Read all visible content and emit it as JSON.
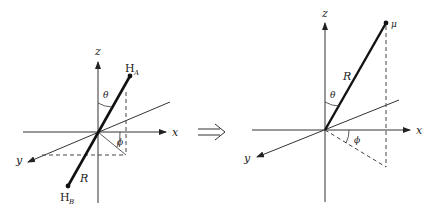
{
  "diagram": {
    "left": {
      "axes": {
        "x": "x",
        "y": "y",
        "z": "z"
      },
      "atom_a": {
        "label": "H",
        "subscript": "A"
      },
      "atom_b": {
        "label": "H",
        "subscript": "B"
      },
      "bond_label": "R",
      "polar_angle": "θ",
      "azimuth_angle": "ϕ"
    },
    "transition_arrow": "⟹",
    "right": {
      "axes": {
        "x": "x",
        "y": "y",
        "z": "z"
      },
      "point_label": "μ",
      "vector_label": "R",
      "polar_angle": "θ",
      "azimuth_angle": "ϕ"
    },
    "colors": {
      "stroke": "#222222",
      "background": "#ffffff"
    }
  }
}
